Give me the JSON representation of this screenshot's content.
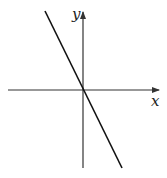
{
  "diagram": {
    "title": "",
    "axes": {
      "x_label": "x",
      "y_label": "y",
      "origin": [
        83,
        90
      ]
    },
    "line": {
      "description": "Straight line through origin with negative slope",
      "slope_sign": "negative",
      "passes_through_origin": true
    },
    "colors": {
      "axis": "#333333",
      "line": "#111111",
      "background": "#ffffff"
    }
  }
}
